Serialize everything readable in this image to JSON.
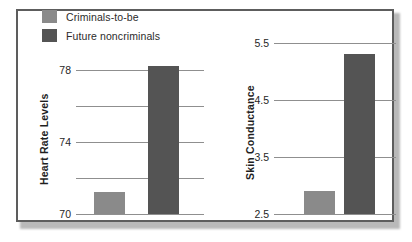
{
  "figure": {
    "frame_color": "#5d5d5d",
    "background": "#ffffff"
  },
  "legend": {
    "position": "top-left",
    "items": [
      {
        "label": "Criminals-to-be",
        "color": "#8a8a8a",
        "swatch_name": "legend-swatch-criminals-to-be"
      },
      {
        "label": "Future noncriminals",
        "color": "#545454",
        "swatch_name": "legend-swatch-future-noncriminals"
      }
    ]
  },
  "chart_data": [
    {
      "type": "bar",
      "title": "",
      "xlabel": "",
      "ylabel": "Heart Rate Levels",
      "ylim": [
        70,
        79
      ],
      "grid": true,
      "gridlines": [
        70,
        72,
        74,
        76,
        78
      ],
      "yticks": [
        70,
        74,
        78
      ],
      "ytick_labels": [
        "70",
        "74",
        "78"
      ],
      "categories": [
        "Criminals-to-be",
        "Future noncriminals"
      ],
      "values": [
        71.2,
        78.2
      ],
      "colors": [
        "#8a8a8a",
        "#545454"
      ],
      "legend_position": "figure top-left"
    },
    {
      "type": "bar",
      "title": "",
      "xlabel": "",
      "ylabel": "Skin Conductance",
      "ylim": [
        2.5,
        5.6
      ],
      "grid": true,
      "gridlines": [
        2.5,
        3.5,
        4.5,
        5.5
      ],
      "yticks": [
        2.5,
        3.5,
        4.5,
        5.5
      ],
      "ytick_labels": [
        "2.5",
        "3.5",
        "4.5",
        "5.5"
      ],
      "categories": [
        "Criminals-to-be",
        "Future noncriminals"
      ],
      "values": [
        2.9,
        5.3
      ],
      "colors": [
        "#8a8a8a",
        "#545454"
      ],
      "legend_position": "figure top-left"
    }
  ]
}
